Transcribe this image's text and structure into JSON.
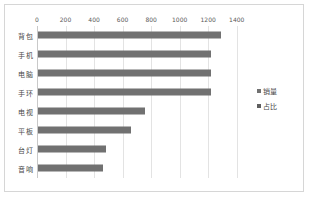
{
  "chart_data": {
    "type": "bar",
    "orientation": "horizontal",
    "title": "",
    "xlabel": "",
    "ylabel": "",
    "categories": [
      "背包",
      "手机",
      "电脑",
      "手环",
      "电视",
      "平板",
      "台灯",
      "音响"
    ],
    "series": [
      {
        "name": "销量",
        "color": "#717171",
        "values": [
          1280,
          1215,
          1215,
          1210,
          750,
          650,
          475,
          455
        ]
      },
      {
        "name": "占比",
        "color": "#5e5e5e",
        "values": [
          0,
          0,
          0,
          0,
          0,
          0,
          0,
          0
        ]
      }
    ],
    "xlim": [
      0,
      1500
    ],
    "xticks": [
      0,
      200,
      400,
      600,
      800,
      1000,
      1200,
      1400
    ],
    "xtick_labels": [
      "0",
      "200",
      "400",
      "600",
      "800",
      "1000",
      "1200",
      "1400"
    ],
    "grid": true,
    "grid_axis": "x",
    "legend": true,
    "legend_position": "right",
    "legend_entries": [
      "销量",
      "占比"
    ],
    "background_color": "#ffffff",
    "border_color": "#d6d6d6",
    "gridline_color": "#e3e3e3"
  }
}
